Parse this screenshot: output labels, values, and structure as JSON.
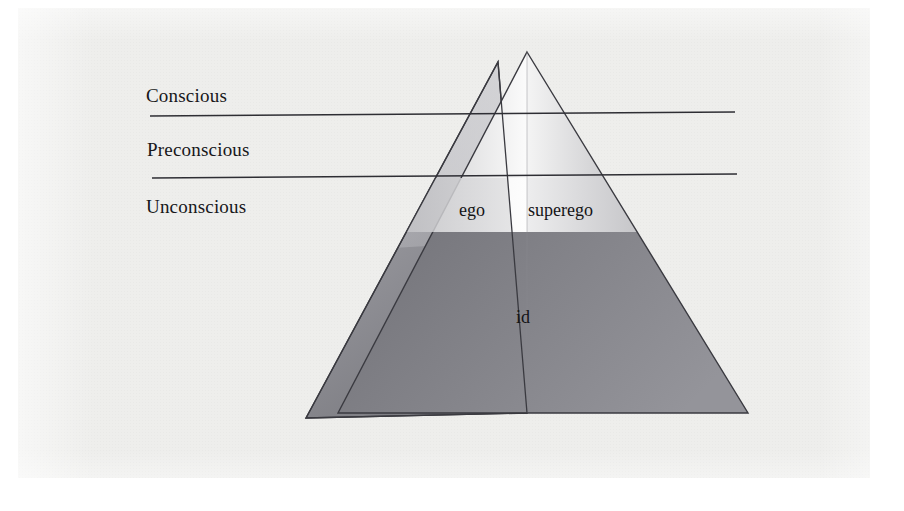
{
  "figure": {
    "kind": "freud-structural-model-pyramid",
    "background_color": "#eeeeec",
    "stroke_color": "#3a3a40"
  },
  "level_labels": [
    {
      "id": "conscious",
      "text": "Conscious"
    },
    {
      "id": "preconscious",
      "text": "Preconscious"
    },
    {
      "id": "unconscious",
      "text": "Unconscious"
    }
  ],
  "divider_lines": [
    {
      "id": "conscious-preconscious-divider",
      "x1": 150,
      "y1": 116,
      "x2": 735,
      "y2": 112
    },
    {
      "id": "preconscious-unconscious-divider",
      "x1": 152,
      "y1": 178,
      "x2": 737,
      "y2": 174
    }
  ],
  "pyramid": {
    "apex": {
      "x": 527,
      "y": 52
    },
    "front_left": {
      "x": 338,
      "y": 413
    },
    "front_right": {
      "x": 748,
      "y": 413
    },
    "side_left": {
      "x": 306,
      "y": 418
    },
    "side_top": {
      "x": 498,
      "y": 62
    },
    "ridge_bottom": {
      "x": 527,
      "y": 413
    },
    "band_top_y": 178,
    "band_bottom_y": 232
  },
  "pyramid_labels": [
    {
      "id": "ego",
      "text": "ego"
    },
    {
      "id": "superego",
      "text": "superego"
    },
    {
      "id": "id",
      "text": "id"
    }
  ],
  "chart_data": {
    "type": "diagram",
    "title": "",
    "regions": [
      {
        "name": "Conscious",
        "kind": "awareness-level",
        "order": 1
      },
      {
        "name": "Preconscious",
        "kind": "awareness-level",
        "order": 2
      },
      {
        "name": "Unconscious",
        "kind": "awareness-level",
        "order": 3
      }
    ],
    "structures": [
      {
        "name": "ego",
        "spans": [
          "Conscious",
          "Preconscious",
          "Unconscious"
        ]
      },
      {
        "name": "superego",
        "spans": [
          "Conscious",
          "Preconscious",
          "Unconscious"
        ]
      },
      {
        "name": "id",
        "spans": [
          "Unconscious"
        ]
      }
    ]
  }
}
